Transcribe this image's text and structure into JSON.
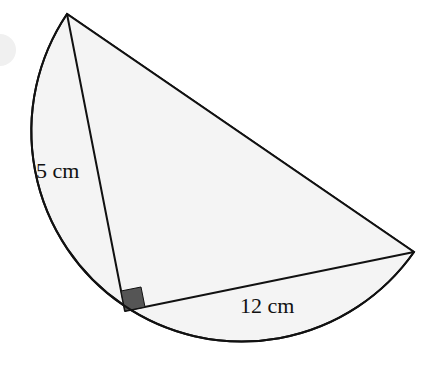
{
  "diagram": {
    "type": "geometry",
    "labels": {
      "short_leg": "5 cm",
      "long_leg": "12 cm"
    },
    "vertices": {
      "top": [
        67,
        14
      ],
      "right_angle": [
        125,
        311
      ],
      "right": [
        414,
        252
      ]
    },
    "colors": {
      "stroke": "#111111",
      "fill": "#f4f4f4",
      "right_angle_marker": "#555555",
      "background": "#ffffff",
      "faint_circle": "#f0f0f0"
    }
  }
}
